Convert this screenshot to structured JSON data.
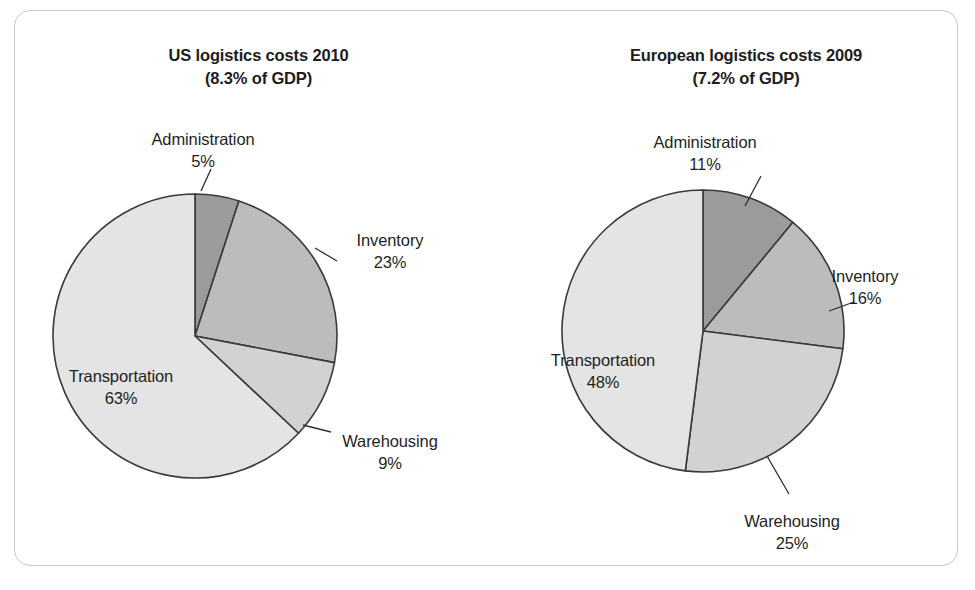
{
  "figure": {
    "border_color": "#c9c9c9",
    "background": "#ffffff"
  },
  "palette": {
    "administration": "#9b9b9b",
    "inventory": "#bcbcbc",
    "warehousing": "#d2d2d2",
    "transportation": "#e4e4e4",
    "slice_outline": "#3a3a3a",
    "text": "#1f1f1f"
  },
  "charts": [
    {
      "id": "us",
      "title_main": "US logistics costs 2010",
      "title_sub": "(8.3% of GDP)",
      "labels": {
        "administration": "Administration",
        "administration_value": "5%",
        "inventory": "Inventory",
        "inventory_value": "23%",
        "warehousing": "Warehousing",
        "warehousing_value": "9%",
        "transportation": "Transportation",
        "transportation_value": "63%"
      }
    },
    {
      "id": "europe",
      "title_main": "European logistics costs 2009",
      "title_sub": "(7.2% of GDP)",
      "labels": {
        "administration": "Administration",
        "administration_value": "11%",
        "inventory": "Inventory",
        "inventory_value": "16%",
        "warehousing": "Warehousing",
        "warehousing_value": "25%",
        "transportation": "Transportation",
        "transportation_value": "48%"
      }
    }
  ],
  "chart_data": [
    {
      "type": "pie",
      "title": "US logistics costs 2010 (8.3% of GDP)",
      "subtitle": "(8.3% of GDP)",
      "unit": "percent",
      "start_angle_deg": 0,
      "direction": "clockwise",
      "legend": "none (direct labels with leader lines)",
      "categories": [
        "Administration",
        "Inventory",
        "Warehousing",
        "Transportation"
      ],
      "values": [
        5,
        23,
        9,
        63
      ],
      "colors": [
        "#9b9b9b",
        "#bcbcbc",
        "#d2d2d2",
        "#e4e4e4"
      ],
      "labels": [
        "5%",
        "23%",
        "9%",
        "63%"
      ],
      "label_placement": [
        "outside",
        "outside",
        "outside",
        "inside"
      ]
    },
    {
      "type": "pie",
      "title": "European logistics costs 2009 (7.2% of GDP)",
      "subtitle": "(7.2% of GDP)",
      "unit": "percent",
      "start_angle_deg": 0,
      "direction": "clockwise",
      "legend": "none (direct labels with leader lines)",
      "categories": [
        "Administration",
        "Inventory",
        "Warehousing",
        "Transportation"
      ],
      "values": [
        11,
        16,
        25,
        48
      ],
      "colors": [
        "#9b9b9b",
        "#bcbcbc",
        "#d2d2d2",
        "#e4e4e4"
      ],
      "labels": [
        "11%",
        "16%",
        "25%",
        "48%"
      ],
      "label_placement": [
        "outside",
        "outside",
        "outside",
        "inside"
      ]
    }
  ]
}
